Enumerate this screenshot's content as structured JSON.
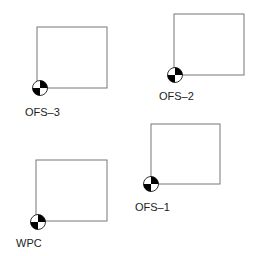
{
  "frames": [
    {
      "id": "ofs3",
      "label": "OFS–3",
      "box": {
        "x": 37,
        "y": 27,
        "w": 70,
        "h": 61
      },
      "origin": {
        "cx": 40,
        "cy": 88
      },
      "label_pos": {
        "x": 25,
        "y": 107
      }
    },
    {
      "id": "ofs2",
      "label": "OFS–2",
      "box": {
        "x": 174,
        "y": 14,
        "w": 70,
        "h": 61
      },
      "origin": {
        "cx": 175,
        "cy": 75
      },
      "label_pos": {
        "x": 159,
        "y": 91
      }
    },
    {
      "id": "wpc",
      "label": "WPC",
      "box": {
        "x": 36,
        "y": 160,
        "w": 71,
        "h": 61
      },
      "origin": {
        "cx": 38,
        "cy": 222
      },
      "label_pos": {
        "x": 16,
        "y": 238
      }
    },
    {
      "id": "ofs1",
      "label": "OFS–1",
      "box": {
        "x": 151,
        "y": 124,
        "w": 69,
        "h": 60
      },
      "origin": {
        "cx": 151,
        "cy": 184
      },
      "label_pos": {
        "x": 135,
        "y": 202
      }
    }
  ],
  "colors": {
    "box_stroke": "#777777",
    "marker": "#000000"
  }
}
